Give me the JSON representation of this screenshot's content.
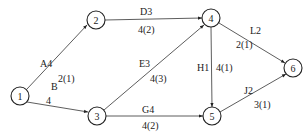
{
  "diagram": {
    "type": "activity-network",
    "nodes": [
      {
        "id": "1",
        "label": "1",
        "x": 20,
        "y": 96
      },
      {
        "id": "2",
        "label": "2",
        "x": 96,
        "y": 20
      },
      {
        "id": "3",
        "label": "3",
        "x": 97,
        "y": 116
      },
      {
        "id": "4",
        "label": "4",
        "x": 211,
        "y": 18
      },
      {
        "id": "5",
        "label": "5",
        "x": 212,
        "y": 116
      },
      {
        "id": "6",
        "label": "6",
        "x": 293,
        "y": 68
      }
    ],
    "edges": [
      {
        "from": "1",
        "to": "2",
        "name": "A4",
        "value": "2(1)"
      },
      {
        "from": "1",
        "to": "3",
        "name": "B",
        "value": "4"
      },
      {
        "from": "2",
        "to": "4",
        "name": "D3",
        "value": "4(2)"
      },
      {
        "from": "3",
        "to": "4",
        "name": "E3",
        "value": "4(3)"
      },
      {
        "from": "3",
        "to": "5",
        "name": "G4",
        "value": "4(2)"
      },
      {
        "from": "4",
        "to": "5",
        "name": "H1",
        "value": "4(1)"
      },
      {
        "from": "4",
        "to": "6",
        "name": "L2",
        "value": "2(1)"
      },
      {
        "from": "5",
        "to": "6",
        "name": "J2",
        "value": "3(1)"
      }
    ]
  }
}
